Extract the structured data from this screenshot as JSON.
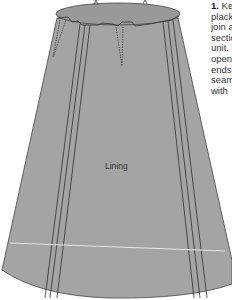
{
  "figure": {
    "label": "Lining",
    "colors": {
      "fabric": "#a4a4a4",
      "top": "#999999",
      "outline": "#444444",
      "seam": "#2e2e2e",
      "hem_line": "#e6e6e6"
    }
  },
  "caption": {
    "number": "1.",
    "lines": [
      "Ke",
      "plack",
      "join a",
      "sectio",
      "unit.",
      "open",
      "ends",
      "seam",
      "with"
    ]
  }
}
